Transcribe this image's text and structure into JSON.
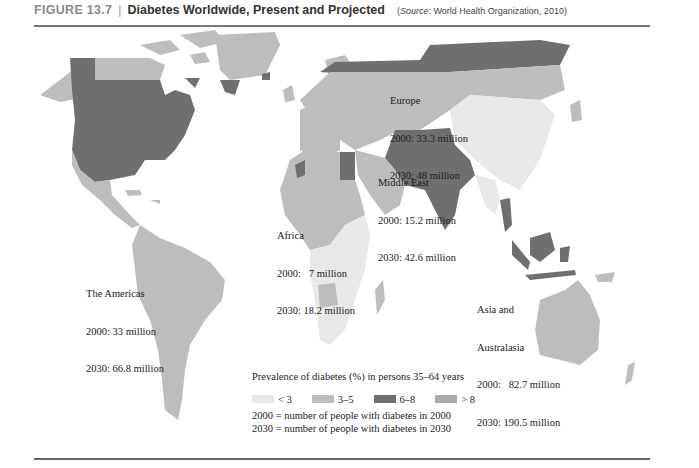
{
  "header": {
    "figure_label": "FIGURE 13.7",
    "separator": "|",
    "title": "Diabetes Worldwide, Present and Projected",
    "source_prefix": "Source:",
    "source_text": "World Health Organization, 2010"
  },
  "colors": {
    "lt3": "#e8e8e8",
    "3to5": "#bdbdbd",
    "6to8": "#6f6f6f",
    "gt8": "#a9a9a9",
    "ocean": "#ffffff"
  },
  "regions": [
    {
      "name": "Europe",
      "line2000": "2000: 33.3 million",
      "line2030": "2030: 48 million"
    },
    {
      "name": "Middle East",
      "line2000": "2000: 15.2 million",
      "line2030": "2030: 42.6 million"
    },
    {
      "name": "Africa",
      "line2000": "2000:   7 million",
      "line2030": "2030: 18.2 million"
    },
    {
      "name": "The Americas",
      "line2000": "2000: 33 million",
      "line2030": "2030: 66.8 million"
    },
    {
      "name_line1": "Asia and",
      "name_line2": "Australasia",
      "line2000": "2000:   82.7 million",
      "line2030": "2030: 190.5 million"
    }
  ],
  "legend": {
    "title": "Prevalence of diabetes (%) in persons 35–64 years",
    "items": [
      {
        "label": "< 3",
        "color": "#e8e8e8"
      },
      {
        "label": "3–5",
        "color": "#bdbdbd"
      },
      {
        "label": "6–8",
        "color": "#6f6f6f"
      },
      {
        "label": "> 8",
        "color": "#a9a9a9"
      }
    ],
    "note_2000": "2000 = number of people with diabetes in 2000",
    "note_2030": "2030 = number of people with diabetes in 2030"
  }
}
